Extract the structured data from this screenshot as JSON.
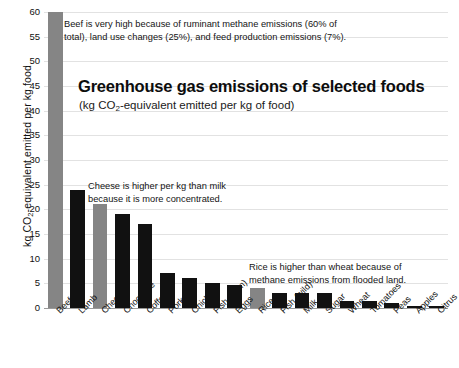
{
  "chart_data": {
    "type": "bar",
    "title": "Greenhouse gas emissions of selected foods",
    "subtitle_prefix": "(kg CO",
    "subtitle_suffix": "-equivalent emitted per kg of food)",
    "subtitle_sub": "2",
    "subtitle_full": "(kg CO2-equivalent emitted per kg of food)",
    "xlabel": "",
    "ylabel_prefix": "kg CO",
    "ylabel_sub": "2",
    "ylabel_suffix": "-equivalent emitted per kg food",
    "ylabel_full": "kg CO2-equivalent emitted per kg food",
    "ylim": [
      0,
      60
    ],
    "ytick_labels": [
      "0",
      "5",
      "10",
      "15",
      "20",
      "25",
      "30",
      "35",
      "40",
      "45",
      "50",
      "55",
      "60"
    ],
    "ytick_values": [
      0,
      5,
      10,
      15,
      20,
      25,
      30,
      35,
      40,
      45,
      50,
      55,
      60
    ],
    "grid": true,
    "legend": false,
    "categories": [
      "Beef",
      "Lamb",
      "Cheese",
      "Chocolate",
      "Coffee",
      "Pork",
      "Chicken",
      "Fish (farm)",
      "Eggs",
      "Rice",
      "Fish (wild)",
      "Milk",
      "Sugar",
      "Wheat",
      "Tomatoes",
      "Peas",
      "Apples",
      "Citrus"
    ],
    "values": [
      60,
      24,
      21,
      19,
      17,
      7,
      6,
      5,
      4.6,
      4,
      3,
      3,
      3,
      1.5,
      1.5,
      1,
      0.5,
      0.4
    ],
    "bar_colors": [
      "#858585",
      "#111111",
      "#858585",
      "#111111",
      "#111111",
      "#111111",
      "#111111",
      "#111111",
      "#111111",
      "#858585",
      "#111111",
      "#111111",
      "#111111",
      "#111111",
      "#111111",
      "#111111",
      "#111111",
      "#111111"
    ],
    "highlight_color": "#858585",
    "default_bar_color": "#111111",
    "gridline_color": "#e2e2e2",
    "background_color": "#ffffff",
    "annotations": [
      {
        "name": "beef",
        "line1": "Beef is very high because of ruminant methane emissions (60% of",
        "line2": "total), land use changes (25%), and feed production emissions (7%)."
      },
      {
        "name": "cheese",
        "line1": "Cheese is higher per kg than milk",
        "line2": "because it is more concentrated."
      },
      {
        "name": "rice",
        "line1": "Rice is higher than wheat because of",
        "line2": "methane emissions from flooded land."
      }
    ]
  }
}
